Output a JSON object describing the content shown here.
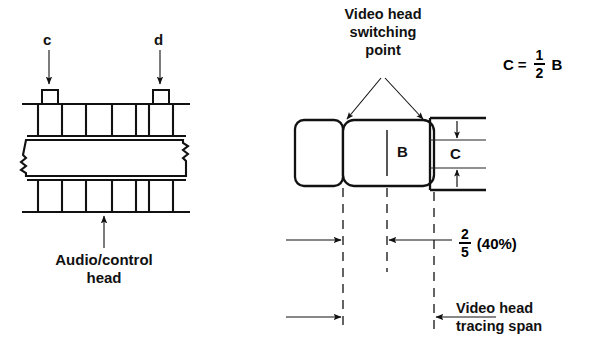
{
  "figure": {
    "left_diagram": {
      "name": "audio-control-head-diagram",
      "pointer_labels": [
        {
          "id": "c",
          "text": "c"
        },
        {
          "id": "d",
          "text": "d"
        }
      ],
      "caption": "Audio/control\nhead",
      "caption_line1": "Audio/control",
      "caption_line2": "head"
    },
    "right_diagram": {
      "name": "video-head-tracing-diagram",
      "switching_point_label_line1": "Video head",
      "switching_point_label_line2": "switching",
      "switching_point_label_line3": "point",
      "dimension_B": "B",
      "dimension_C": "C",
      "equation": {
        "lhs": "C",
        "equals": "=",
        "numerator": "1",
        "denominator": "2",
        "rhs": "B"
      },
      "fraction_annotation": {
        "numerator": "2",
        "denominator": "5",
        "percent": "(40%)"
      },
      "tracing_span_label_line1": "Video head",
      "tracing_span_label_line2": "tracing span"
    }
  },
  "colors": {
    "stroke": "#111111",
    "background": "#ffffff",
    "thin_stroke": "#222222"
  }
}
